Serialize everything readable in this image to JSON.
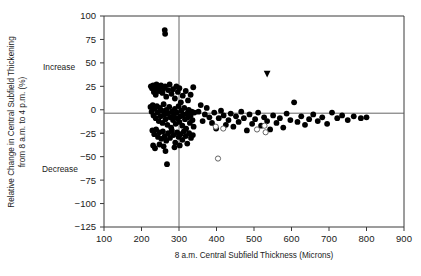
{
  "chart_data": {
    "type": "scatter",
    "title": "",
    "xlabel": "8 a.m. Central Subfield Thickness (Microns)",
    "ylabel": "Relative Change in Central Subfield Thickening from 8 a.m. to 4 p.m. (%)",
    "xlim": [
      100,
      900
    ],
    "ylim": [
      -125,
      100
    ],
    "xticks": [
      100,
      200,
      300,
      400,
      500,
      600,
      700,
      800,
      900
    ],
    "yticks": [
      100,
      75,
      50,
      25,
      0,
      -25,
      -50,
      -75,
      -100,
      -125
    ],
    "xtick_labels": [
      "100",
      "200",
      "300",
      "400",
      "500",
      "600",
      "700",
      "800",
      "900"
    ],
    "ytick_labels": [
      "100",
      "75",
      "50",
      "25",
      "0",
      "-25",
      "-50",
      "-75",
      "-100",
      "-125"
    ],
    "grid": false,
    "legend_position": "none",
    "annotations": [
      {
        "name": "increase-note",
        "text": "Increase",
        "x_value": 100,
        "y_value": 50
      },
      {
        "name": "decrease-note",
        "text": "Decrease",
        "x_value": 100,
        "y_value": -60
      }
    ],
    "reference_lines": [
      {
        "name": "zero-change-line",
        "orientation": "horizontal",
        "y_value": 0
      },
      {
        "name": "threshold-thickness-line",
        "orientation": "vertical",
        "x_value": 300
      }
    ],
    "series": [
      {
        "name": "Filled circles",
        "marker": "filled-circle",
        "color": "#000000",
        "points": [
          [
            262,
            85
          ],
          [
            263,
            81
          ],
          [
            225,
            25
          ],
          [
            228,
            23
          ],
          [
            231,
            26
          ],
          [
            236,
            22
          ],
          [
            240,
            27
          ],
          [
            233,
            19
          ],
          [
            238,
            16
          ],
          [
            245,
            24
          ],
          [
            247,
            20
          ],
          [
            252,
            26
          ],
          [
            256,
            18
          ],
          [
            259,
            23
          ],
          [
            263,
            25
          ],
          [
            266,
            14
          ],
          [
            271,
            21
          ],
          [
            275,
            27
          ],
          [
            280,
            17
          ],
          [
            284,
            22
          ],
          [
            289,
            12
          ],
          [
            293,
            25
          ],
          [
            297,
            19
          ],
          [
            301,
            23
          ],
          [
            305,
            8
          ],
          [
            310,
            15
          ],
          [
            318,
            20
          ],
          [
            324,
            10
          ],
          [
            331,
            16
          ],
          [
            338,
            24
          ],
          [
            224,
            3
          ],
          [
            227,
            -2
          ],
          [
            230,
            5
          ],
          [
            232,
            -6
          ],
          [
            235,
            1
          ],
          [
            238,
            -9
          ],
          [
            241,
            4
          ],
          [
            243,
            -3
          ],
          [
            246,
            -12
          ],
          [
            249,
            2
          ],
          [
            251,
            -7
          ],
          [
            254,
            -1
          ],
          [
            256,
            -14
          ],
          [
            259,
            6
          ],
          [
            261,
            -5
          ],
          [
            264,
            -10
          ],
          [
            266,
            0
          ],
          [
            269,
            -16
          ],
          [
            271,
            -4
          ],
          [
            274,
            3
          ],
          [
            276,
            -8
          ],
          [
            279,
            -19
          ],
          [
            281,
            -2
          ],
          [
            284,
            -11
          ],
          [
            286,
            -6
          ],
          [
            289,
            1
          ],
          [
            291,
            -15
          ],
          [
            294,
            -3
          ],
          [
            296,
            -9
          ],
          [
            299,
            4
          ],
          [
            301,
            -13
          ],
          [
            304,
            -7
          ],
          [
            306,
            -1
          ],
          [
            309,
            -17
          ],
          [
            311,
            -5
          ],
          [
            314,
            2
          ],
          [
            316,
            -10
          ],
          [
            319,
            -20
          ],
          [
            321,
            -4
          ],
          [
            324,
            -8
          ],
          [
            326,
            0
          ],
          [
            329,
            -14
          ],
          [
            331,
            -6
          ],
          [
            334,
            -2
          ],
          [
            336,
            -11
          ],
          [
            339,
            -18
          ],
          [
            341,
            -3
          ],
          [
            229,
            -22
          ],
          [
            234,
            -26
          ],
          [
            239,
            -21
          ],
          [
            244,
            -29
          ],
          [
            248,
            -24
          ],
          [
            253,
            -31
          ],
          [
            257,
            -23
          ],
          [
            262,
            -28
          ],
          [
            266,
            -33
          ],
          [
            271,
            -25
          ],
          [
            276,
            -30
          ],
          [
            281,
            -22
          ],
          [
            285,
            -27
          ],
          [
            290,
            -35
          ],
          [
            295,
            -24
          ],
          [
            299,
            -29
          ],
          [
            304,
            -26
          ],
          [
            309,
            -32
          ],
          [
            313,
            -23
          ],
          [
            318,
            -28
          ],
          [
            322,
            -36
          ],
          [
            327,
            -25
          ],
          [
            332,
            -30
          ],
          [
            337,
            -27
          ],
          [
            231,
            -38
          ],
          [
            248,
            -37
          ],
          [
            259,
            -39
          ],
          [
            288,
            -40
          ],
          [
            302,
            -38
          ],
          [
            236,
            -41
          ],
          [
            268,
            -58
          ],
          [
            264,
            -44
          ],
          [
            352,
            -2
          ],
          [
            358,
            5
          ],
          [
            363,
            -12
          ],
          [
            369,
            -5
          ],
          [
            374,
            2
          ],
          [
            381,
            -8
          ],
          [
            388,
            -14
          ],
          [
            394,
            -3
          ],
          [
            399,
            -20
          ],
          [
            406,
            -9
          ],
          [
            412,
            -1
          ],
          [
            419,
            -6
          ],
          [
            425,
            -16
          ],
          [
            432,
            -11
          ],
          [
            438,
            -4
          ],
          [
            445,
            -18
          ],
          [
            452,
            -7
          ],
          [
            459,
            -13
          ],
          [
            466,
            -2
          ],
          [
            473,
            -9
          ],
          [
            481,
            -22
          ],
          [
            488,
            -5
          ],
          [
            495,
            -15
          ],
          [
            503,
            -10
          ],
          [
            511,
            -3
          ],
          [
            519,
            -17
          ],
          [
            527,
            -8
          ],
          [
            535,
            -12
          ],
          [
            543,
            -21
          ],
          [
            551,
            -6
          ],
          [
            560,
            -14
          ],
          [
            569,
            -9
          ],
          [
            578,
            -19
          ],
          [
            587,
            -4
          ],
          [
            597,
            -11
          ],
          [
            607,
            8
          ],
          [
            616,
            -13
          ],
          [
            626,
            -7
          ],
          [
            636,
            -16
          ],
          [
            647,
            -10
          ],
          [
            658,
            -5
          ],
          [
            670,
            -12
          ],
          [
            682,
            -8
          ],
          [
            695,
            -15
          ],
          [
            708,
            -3
          ],
          [
            722,
            -9
          ],
          [
            735,
            -6
          ],
          [
            750,
            -11
          ],
          [
            766,
            -7
          ],
          [
            785,
            -9
          ],
          [
            800,
            -8
          ]
        ]
      },
      {
        "name": "Open circles",
        "marker": "open-circle",
        "color": "#ffffff",
        "points": [
          [
            398,
            -18
          ],
          [
            404,
            -52
          ],
          [
            418,
            -20
          ],
          [
            508,
            -21
          ],
          [
            528,
            -17
          ],
          [
            531,
            -24
          ]
        ]
      },
      {
        "name": "Down triangle",
        "marker": "down-triangle",
        "color": "#000000",
        "points": [
          [
            535,
            38
          ]
        ]
      }
    ]
  },
  "axes": {
    "x_title": "8 a.m. Central Subfield Thickness (Microns)",
    "y_title_line1": "Relative Change in Central Subfield Thickening",
    "y_title_line2": "from 8 a.m. to 4 p.m. (%)"
  },
  "notes": {
    "increase": "Increase",
    "decrease": "Decrease"
  }
}
